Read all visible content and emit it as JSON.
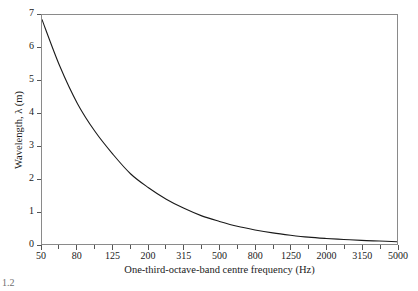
{
  "figure": {
    "caption_fragment": "1.2",
    "line_color": "#1a1a1a",
    "frame_color": "#8a8a8a",
    "background_color": "#ffffff"
  },
  "chart_data": {
    "type": "line",
    "title": "",
    "subtitle": "",
    "xlabel": "One-third-octave-band centre frequency (Hz)",
    "ylabel": "Wavelength, λ (m)",
    "x_scale": "one-third-octave bands (equally spaced)",
    "grid": false,
    "legend": null,
    "ylim": [
      0,
      7
    ],
    "y_ticks": [
      0,
      1,
      2,
      3,
      4,
      5,
      6,
      7
    ],
    "y_tick_labels": [
      "0",
      "1",
      "2",
      "3",
      "4",
      "5",
      "6",
      "7"
    ],
    "x_tick_labels": [
      "50",
      "80",
      "125",
      "200",
      "315",
      "500",
      "800",
      "1250",
      "2000",
      "3150",
      "5000"
    ],
    "x_all_bands": [
      50,
      63,
      80,
      100,
      125,
      160,
      200,
      250,
      315,
      400,
      500,
      630,
      800,
      1000,
      1250,
      1600,
      2000,
      2500,
      3150,
      4000,
      5000
    ],
    "speed_of_sound": 343,
    "series": [
      {
        "name": "Wavelength",
        "x": [
          50,
          63,
          80,
          100,
          125,
          160,
          200,
          250,
          315,
          400,
          500,
          630,
          800,
          1000,
          1250,
          1600,
          2000,
          2500,
          3150,
          4000,
          5000
        ],
        "values": [
          6.86,
          5.44,
          4.29,
          3.43,
          2.74,
          2.14,
          1.72,
          1.37,
          1.09,
          0.86,
          0.69,
          0.54,
          0.43,
          0.34,
          0.27,
          0.21,
          0.17,
          0.14,
          0.11,
          0.09,
          0.07
        ]
      }
    ]
  }
}
